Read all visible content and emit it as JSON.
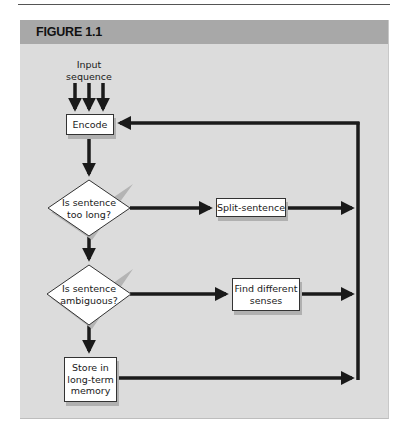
{
  "figure": {
    "title": "FIGURE 1.1"
  },
  "nodes": {
    "input": {
      "line1": "Input",
      "line2": "sequence"
    },
    "encode": {
      "label": "Encode"
    },
    "decision_long": {
      "line1": "Is sentence",
      "line2": "too long?"
    },
    "split": {
      "label": "Split-sentence"
    },
    "decision_ambiguous": {
      "line1": "Is sentence",
      "line2": "ambiguous?"
    },
    "senses": {
      "line1": "Find different",
      "line2": "senses"
    },
    "store": {
      "line1": "Store in",
      "line2": "long-term",
      "line3": "memory"
    }
  },
  "colors": {
    "header": "#a8a8a8",
    "panel": "#dcdcdc",
    "arrow": "#1a1a1a",
    "box": "#ffffff"
  }
}
